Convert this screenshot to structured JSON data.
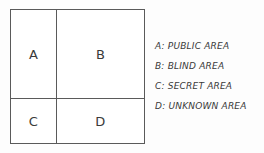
{
  "diagram": {
    "type": "2x2-quadrant-grid",
    "border_color": "#5a5a5a",
    "text_color": "#3a3a3a",
    "background_color": "#ffffff",
    "cells": [
      {
        "id": "A",
        "label": "A",
        "position": "top-left"
      },
      {
        "id": "B",
        "label": "B",
        "position": "top-right"
      },
      {
        "id": "C",
        "label": "C",
        "position": "bottom-left"
      },
      {
        "id": "D",
        "label": "D",
        "position": "bottom-right"
      }
    ]
  },
  "legend": {
    "items": [
      {
        "key": "A",
        "text": "A: PUBLIC  AREA"
      },
      {
        "key": "B",
        "text": "B: BLIND  AREA"
      },
      {
        "key": "C",
        "text": "C: SECRET  AREA"
      },
      {
        "key": "D",
        "text": "D: UNKNOWN  AREA"
      }
    ]
  }
}
